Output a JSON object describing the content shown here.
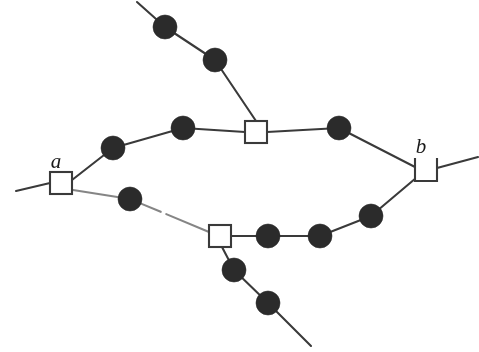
{
  "figure": {
    "width": 479,
    "height": 352,
    "background_color": "#ffffff",
    "stroke_color": "#3a3a3a",
    "node_fill_dark": "#2b2b2b",
    "node_fill_light": "#ffffff"
  },
  "labels": {
    "a": "a",
    "b": "b"
  },
  "square_nodes": [
    {
      "id": "a",
      "name": "square-node-a",
      "cx": 61,
      "cy": 183,
      "size": 22,
      "label": "a",
      "label_x": 56,
      "label_y": 168,
      "open_top": false
    },
    {
      "id": "top",
      "name": "square-node-top",
      "cx": 256,
      "cy": 132,
      "size": 22,
      "label": "",
      "label_x": 0,
      "label_y": 0,
      "open_top": false
    },
    {
      "id": "bot",
      "name": "square-node-bottom",
      "cx": 220,
      "cy": 236,
      "size": 22,
      "label": "",
      "label_x": 0,
      "label_y": 0,
      "open_top": false
    },
    {
      "id": "b",
      "name": "square-node-b",
      "cx": 426,
      "cy": 170,
      "size": 22,
      "label": "b",
      "label_x": 421,
      "label_y": 153,
      "open_top": true
    }
  ],
  "circle_nodes": [
    {
      "name": "circle-node-upper-branch-1",
      "cx": 165,
      "cy": 27,
      "r": 12
    },
    {
      "name": "circle-node-upper-branch-2",
      "cx": 215,
      "cy": 60,
      "r": 12
    },
    {
      "name": "circle-node-upper-path-1",
      "cx": 113,
      "cy": 148,
      "r": 12
    },
    {
      "name": "circle-node-upper-path-2",
      "cx": 183,
      "cy": 128,
      "r": 12
    },
    {
      "name": "circle-node-upper-path-3",
      "cx": 339,
      "cy": 128,
      "r": 12
    },
    {
      "name": "circle-node-lower-path-1",
      "cx": 130,
      "cy": 199,
      "r": 12
    },
    {
      "name": "circle-node-lower-path-2",
      "cx": 268,
      "cy": 236,
      "r": 12
    },
    {
      "name": "circle-node-lower-path-3",
      "cx": 320,
      "cy": 236,
      "r": 12
    },
    {
      "name": "circle-node-lower-path-4",
      "cx": 371,
      "cy": 216,
      "r": 12
    },
    {
      "name": "circle-node-lower-branch-1",
      "cx": 234,
      "cy": 270,
      "r": 12
    },
    {
      "name": "circle-node-lower-branch-2",
      "cx": 268,
      "cy": 303,
      "r": 12
    }
  ],
  "edges": [
    {
      "name": "edge-left-stub-to-a",
      "points": "16,191 50,183",
      "faded": false
    },
    {
      "name": "edge-a-to-upper-path",
      "points": "72,180 113,148 183,128 245,132",
      "faded": false
    },
    {
      "name": "edge-top-square-to-upper-right",
      "points": "267,132 339,128 415,167",
      "faded": false
    },
    {
      "name": "edge-upper-branch-in",
      "points": "137,2 165,27 215,60 256,121",
      "faded": false
    },
    {
      "name": "edge-a-to-lower-path",
      "points": "73,190 130,199 209,232",
      "faded": true
    },
    {
      "name": "edge-bottom-square-to-lower-right",
      "points": "231,236 268,236 320,236 371,216 416,178",
      "faded": false
    },
    {
      "name": "edge-lower-branch-out",
      "points": "222,247 234,270 268,303 311,346",
      "faded": false
    },
    {
      "name": "edge-b-to-right-stub",
      "points": "437,168 478,157",
      "faded": false
    }
  ]
}
